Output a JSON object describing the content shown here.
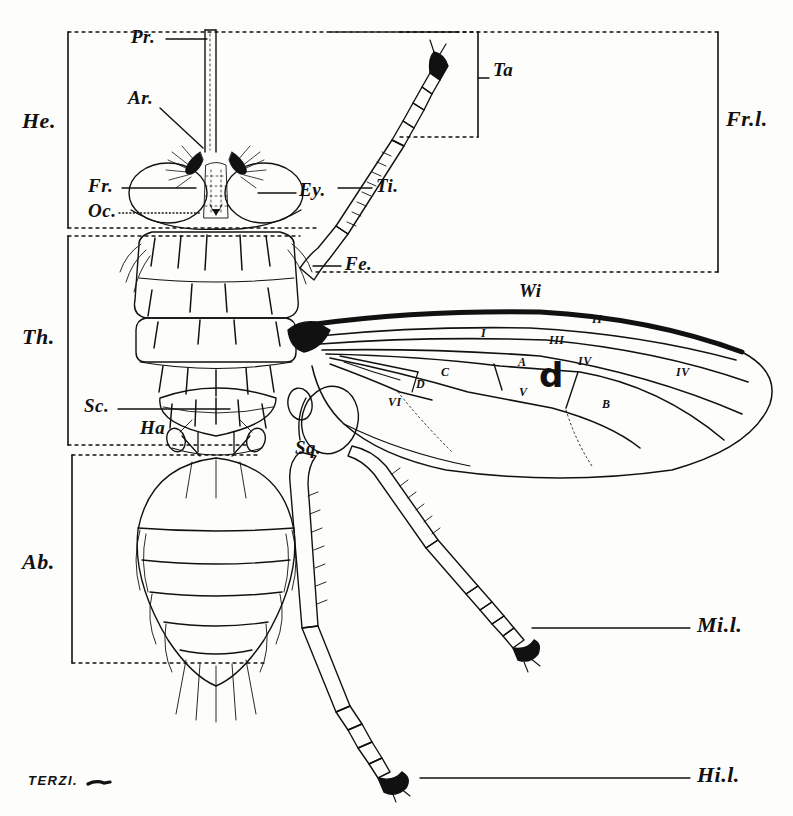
{
  "plate": {
    "title": "Dorsal view of a fly with labelled external anatomy",
    "signature": "TERZI.",
    "ink_color": "#111111",
    "paper_color": "#fdfdfb"
  },
  "brackets": [
    {
      "key": "he",
      "label": "He.",
      "meaning": "Head"
    },
    {
      "key": "th",
      "label": "Th.",
      "meaning": "Thorax"
    },
    {
      "key": "ab",
      "label": "Ab.",
      "meaning": "Abdomen"
    },
    {
      "key": "frl",
      "label": "Fr.l.",
      "meaning": "Fore leg"
    },
    {
      "key": "ta",
      "label": "Ta",
      "meaning": "Tarsus"
    }
  ],
  "labels": [
    {
      "key": "pr",
      "text": "Pr.",
      "meaning": "Proboscis"
    },
    {
      "key": "ar",
      "text": "Ar.",
      "meaning": "Arista"
    },
    {
      "key": "fr",
      "text": "Fr.",
      "meaning": "Frons"
    },
    {
      "key": "oc",
      "text": "Oc.",
      "meaning": "Ocelli"
    },
    {
      "key": "ey",
      "text": "Ey.",
      "meaning": "Eye"
    },
    {
      "key": "ti",
      "text": "Ti.",
      "meaning": "Tibia"
    },
    {
      "key": "fe",
      "text": "Fe.",
      "meaning": "Femur"
    },
    {
      "key": "sc",
      "text": "Sc.",
      "meaning": "Scutellum"
    },
    {
      "key": "ha",
      "text": "Ha",
      "meaning": "Halter"
    },
    {
      "key": "sq",
      "text": "Sq.",
      "meaning": "Squama"
    },
    {
      "key": "wi",
      "text": "Wi",
      "meaning": "Wing"
    },
    {
      "key": "mil",
      "text": "Mi.l.",
      "meaning": "Middle leg"
    },
    {
      "key": "hil",
      "text": "Hi.l.",
      "meaning": "Hind leg"
    }
  ],
  "wing_veins": [
    {
      "key": "v1",
      "text": "I"
    },
    {
      "key": "v2",
      "text": "II"
    },
    {
      "key": "v3",
      "text": "III"
    },
    {
      "key": "v4",
      "text": "IV"
    },
    {
      "key": "v4b",
      "text": "IV"
    },
    {
      "key": "v5",
      "text": "V"
    },
    {
      "key": "v6",
      "text": "VI"
    }
  ],
  "wing_cells": [
    {
      "key": "cA",
      "text": "A"
    },
    {
      "key": "cB",
      "text": "B"
    },
    {
      "key": "cC",
      "text": "C"
    },
    {
      "key": "cD",
      "text": "D"
    },
    {
      "key": "cd",
      "text": "d"
    }
  ]
}
